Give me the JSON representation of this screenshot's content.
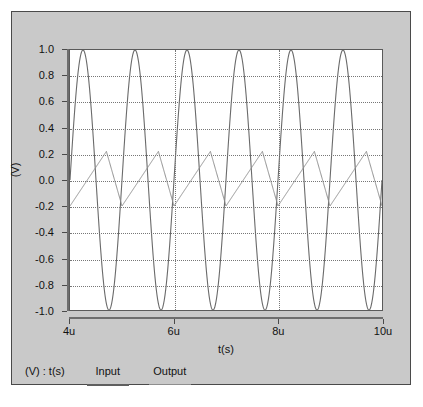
{
  "chart_data": {
    "type": "line",
    "title": "",
    "xlabel": "t(s)",
    "ylabel": "(V)",
    "xlim": [
      4e-06,
      1e-05
    ],
    "ylim": [
      -1.0,
      1.0
    ],
    "grid": true,
    "legend_position": "bottom-left",
    "legend_title": "(V) : t(s)",
    "x_tick_labels": [
      "4u",
      "6u",
      "8u",
      "10u"
    ],
    "x_tick_values": [
      4e-06,
      6e-06,
      8e-06,
      1e-05
    ],
    "y_tick_labels": [
      "1.0",
      "0.8",
      "0.6",
      "0.4",
      "0.2",
      "0.0",
      "-0.2",
      "-0.4",
      "-0.6",
      "-0.8",
      "-1.0"
    ],
    "y_tick_values": [
      1.0,
      0.8,
      0.6,
      0.4,
      0.2,
      0.0,
      -0.2,
      -0.4,
      -0.6,
      -0.8,
      -1.0
    ],
    "series": [
      {
        "name": "Input",
        "waveform": "sine",
        "color": "#6a6a6a",
        "amplitude": 1.0,
        "offset": 0.0,
        "period_s": 1e-06,
        "frequency_hz": 1000000,
        "phase_deg": 0,
        "min": -1.0,
        "max": 1.0
      },
      {
        "name": "Output",
        "waveform": "triangle",
        "color": "#8e8e8e",
        "amplitude": 0.21,
        "offset": 0.01,
        "period_s": 1e-06,
        "frequency_hz": 1000000,
        "rise_fraction": 0.7,
        "min": -0.2,
        "max": 0.22
      }
    ]
  },
  "legend": {
    "title": "(V) : t(s)",
    "items": [
      {
        "label": "Input"
      },
      {
        "label": "Output"
      }
    ]
  },
  "axes": {
    "y_title": "(V)",
    "x_title": "t(s)"
  }
}
